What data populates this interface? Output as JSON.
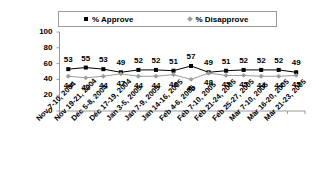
{
  "chart_data": {
    "type": "line",
    "title": "",
    "xlabel": "",
    "ylabel": "",
    "ylim": [
      0,
      100
    ],
    "yticks": [
      0,
      20,
      40,
      60,
      80,
      100
    ],
    "grid": false,
    "legend_position": "top",
    "categories": [
      "Nov 7-10, 2004",
      "Nov 19-21, 2004",
      "Dec 5-8, 2004",
      "Dec 17-19, 2004",
      "Jan 3-5, 2005",
      "Jan 7-9, 2005",
      "Jan 14-16, 2005",
      "Feb 4-6, 2005",
      "Feb 7-10, 2005",
      "Feb 21-24, 2005",
      "Feb 25-27, 2005",
      "Mar 7-10, 2005",
      "Mar 16-20, 2005",
      "Mar 21-23, 2005"
    ],
    "series": [
      {
        "name": "% Approve",
        "marker": "square",
        "color": "#000000",
        "values": [
          53,
          55,
          53,
          49,
          52,
          52,
          51,
          57,
          49,
          51,
          52,
          52,
          52,
          49
        ]
      },
      {
        "name": "% Disapprove",
        "marker": "diamond",
        "color": "#9b9b9b",
        "values": [
          44,
          42,
          44,
          47,
          44,
          44,
          46,
          40,
          48,
          45,
          45,
          44,
          44,
          45
        ]
      }
    ]
  },
  "legend": {
    "items": [
      {
        "label": "% Approve",
        "marker": "square-marker-icon"
      },
      {
        "label": "% Disapprove",
        "marker": "diamond-marker-icon"
      }
    ]
  }
}
